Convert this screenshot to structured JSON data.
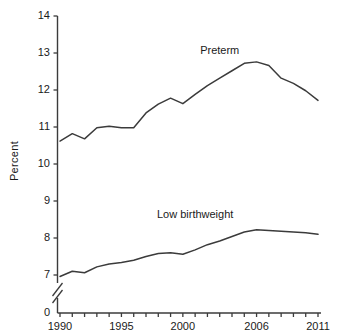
{
  "chart_data": {
    "type": "line",
    "title": "",
    "subtitle": "",
    "xlabel": "",
    "ylabel": "Percent",
    "grid": false,
    "legend_position": "inline-annotation",
    "x": [
      1990,
      1991,
      1992,
      1993,
      1994,
      1995,
      1996,
      1997,
      1998,
      1999,
      2000,
      2001,
      2002,
      2003,
      2004,
      2005,
      2006,
      2007,
      2008,
      2009,
      2010,
      2011
    ],
    "xlim": [
      1989,
      2011.6
    ],
    "xticks": [
      1990,
      1991,
      1992,
      1993,
      1994,
      1995,
      1996,
      1997,
      1998,
      1999,
      2000,
      2001,
      2002,
      2003,
      2004,
      2005,
      2006,
      2007,
      2008,
      2009,
      2010,
      2011
    ],
    "xticklabels": [
      "1990",
      "",
      "",
      "",
      "",
      "1995",
      "",
      "",
      "",
      "",
      "2000",
      "",
      "",
      "",
      "",
      "",
      "2006",
      "",
      "",
      "",
      "",
      "2011"
    ],
    "ylim": [
      7,
      14
    ],
    "yticks": [
      0,
      7,
      8,
      9,
      10,
      11,
      12,
      13,
      14
    ],
    "yticklabels": [
      "0",
      "7",
      "8",
      "9",
      "10",
      "11",
      "12",
      "13",
      "14"
    ],
    "axis_break": true,
    "axis_break_note": "y-axis broken between 0 and 7",
    "series": [
      {
        "name": "Preterm",
        "color": "#3b3b3b",
        "label_x": 2003.0,
        "label_y": 13.05,
        "values": [
          10.62,
          10.82,
          10.68,
          10.98,
          11.02,
          10.98,
          10.98,
          11.38,
          11.62,
          11.78,
          11.63,
          11.88,
          12.12,
          12.32,
          12.52,
          12.72,
          12.76,
          12.66,
          12.32,
          12.18,
          11.98,
          11.72
        ]
      },
      {
        "name": "Low birthweight",
        "color": "#3b3b3b",
        "label_x": 2001.0,
        "label_y": 8.62,
        "values": [
          6.96,
          7.1,
          7.06,
          7.22,
          7.3,
          7.34,
          7.4,
          7.5,
          7.58,
          7.6,
          7.56,
          7.68,
          7.82,
          7.92,
          8.04,
          8.16,
          8.22,
          8.2,
          8.18,
          8.16,
          8.14,
          8.1
        ]
      }
    ]
  }
}
